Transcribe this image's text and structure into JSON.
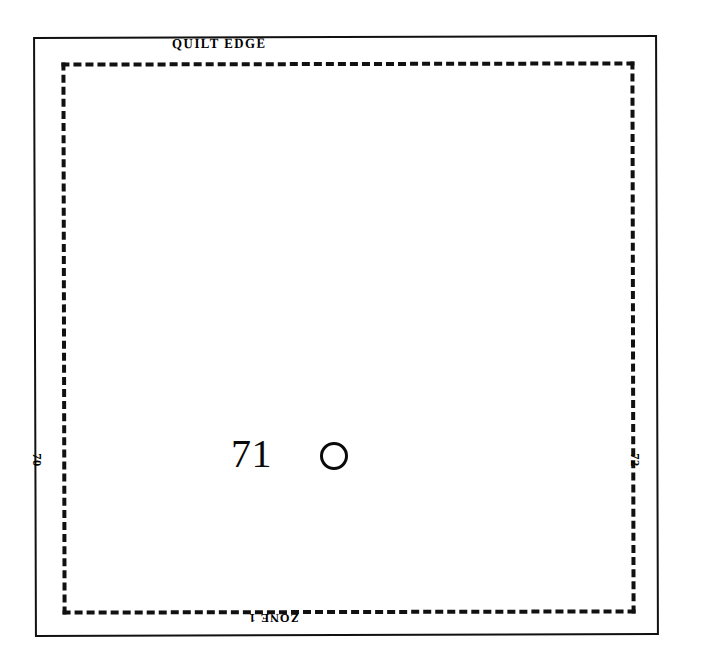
{
  "diagram": {
    "title_label": "QUILT EDGE",
    "zone_label": "ZONE 1",
    "left_column_label": "70",
    "right_column_label": "72",
    "center_block_number": "71",
    "marker_icon": "circle-outline-marker",
    "colors": {
      "background": "#ffffff",
      "ink": "#111111",
      "number_ink": "#0a0a0a"
    },
    "borders": {
      "outer_style": "solid",
      "inner_style": "dashed"
    }
  }
}
